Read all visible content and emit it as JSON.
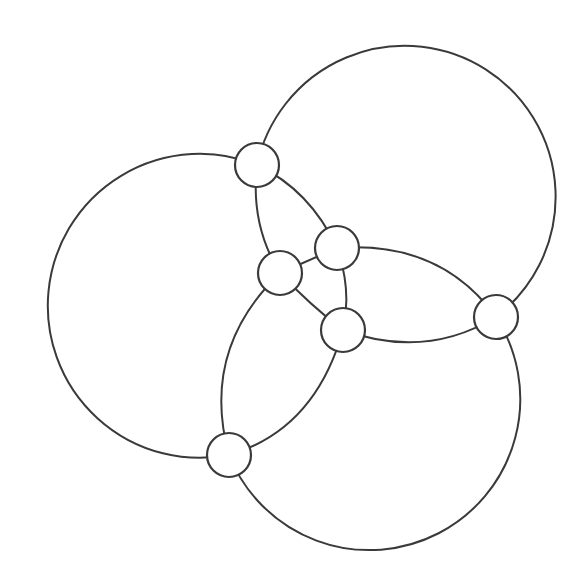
{
  "diagram": {
    "type": "graph",
    "stroke_color": "#3a3a3a",
    "background": "#ffffff",
    "node_radius": 22,
    "nodes": [
      {
        "id": "A",
        "x": 257,
        "y": 165
      },
      {
        "id": "B",
        "x": 496,
        "y": 317
      },
      {
        "id": "C",
        "x": 229,
        "y": 455
      },
      {
        "id": "D",
        "x": 280,
        "y": 273
      },
      {
        "id": "E",
        "x": 337,
        "y": 248
      },
      {
        "id": "G",
        "x": 343,
        "y": 330
      }
    ],
    "edges": [
      {
        "from": "A",
        "to": "B",
        "shape": "large-arc-top"
      },
      {
        "from": "A",
        "to": "C",
        "shape": "large-arc-left"
      },
      {
        "from": "C",
        "to": "B",
        "shape": "large-arc-bottom"
      },
      {
        "from": "A",
        "to": "E",
        "shape": "arc"
      },
      {
        "from": "A",
        "to": "D",
        "shape": "arc"
      },
      {
        "from": "D",
        "to": "E",
        "shape": "line"
      },
      {
        "from": "D",
        "to": "G",
        "shape": "line"
      },
      {
        "from": "E",
        "to": "G",
        "shape": "arc"
      },
      {
        "from": "E",
        "to": "B",
        "shape": "arc"
      },
      {
        "from": "G",
        "to": "B",
        "shape": "arc"
      },
      {
        "from": "D",
        "to": "C",
        "shape": "arc"
      },
      {
        "from": "G",
        "to": "C",
        "shape": "arc"
      }
    ]
  }
}
